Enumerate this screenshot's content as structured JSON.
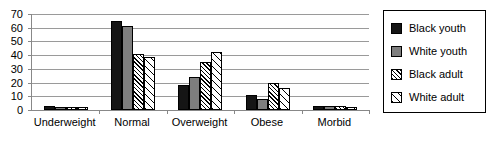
{
  "chart_data": {
    "type": "bar",
    "title": "",
    "xlabel": "",
    "ylabel": "",
    "categories": [
      "Underweight",
      "Normal",
      "Overweight",
      "Obese",
      "Morbid"
    ],
    "series": [
      {
        "name": "Black youth",
        "color": "#151515",
        "pattern": "solid",
        "values": [
          3,
          65,
          18,
          11,
          3
        ]
      },
      {
        "name": "White youth",
        "color": "#7e7e7e",
        "pattern": "gray",
        "values": [
          2,
          61,
          24,
          8,
          3
        ]
      },
      {
        "name": "Black adult",
        "color": "#ffffff",
        "pattern": "dense-hatch",
        "values": [
          2,
          41,
          35,
          20,
          3
        ]
      },
      {
        "name": "White adult",
        "color": "#ffffff",
        "pattern": "sparse-hatch",
        "values": [
          2,
          39,
          42,
          16,
          2
        ]
      }
    ],
    "ylim": [
      0,
      70
    ],
    "yticks": [
      0,
      10,
      20,
      30,
      40,
      50,
      60,
      70
    ],
    "ytick_labels": [
      "0",
      "10",
      "20",
      "30",
      "40",
      "50",
      "60",
      "70"
    ],
    "grid": true,
    "legend_position": "right"
  },
  "legend": {
    "items": [
      {
        "label": "Black youth"
      },
      {
        "label": "White youth"
      },
      {
        "label": "Black adult"
      },
      {
        "label": "White adult"
      }
    ]
  }
}
